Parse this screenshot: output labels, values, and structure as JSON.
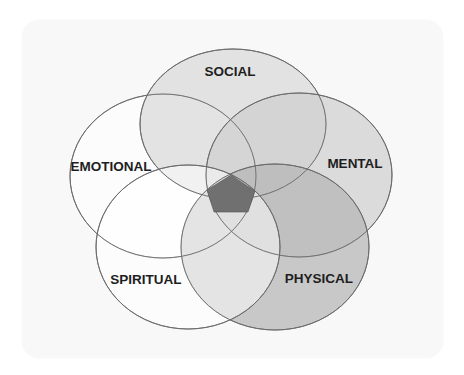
{
  "diagram": {
    "title": "",
    "type": "five-set venn diagram",
    "colors": {
      "card_background": "#f8f8f8",
      "outline": "#6a6a6a",
      "center_pentagon": "#707070",
      "label_text": "#1e1e1e"
    },
    "sets": [
      {
        "id": "social",
        "label": "SOCIAL",
        "fill": "#dcdcdc",
        "opacity": 0.75
      },
      {
        "id": "emotional",
        "label": "EMOTIONAL",
        "fill": "#ffffff",
        "opacity": 0.35
      },
      {
        "id": "mental",
        "label": "MENTAL",
        "fill": "#d4d4d4",
        "opacity": 0.75
      },
      {
        "id": "spiritual",
        "label": "SPIRITUAL",
        "fill": "#ffffff",
        "opacity": 0.45
      },
      {
        "id": "physical",
        "label": "PHYSICAL",
        "fill": "#b8b8b8",
        "opacity": 0.7
      }
    ],
    "center": {
      "label": "",
      "description": "intersection of all five sets"
    }
  }
}
